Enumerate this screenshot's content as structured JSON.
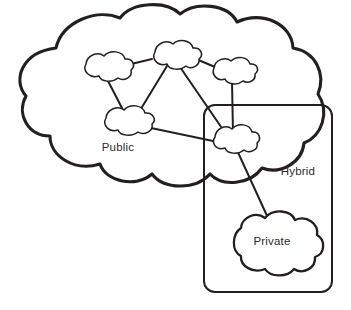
{
  "diagram": {
    "type": "cloud-deployment-models",
    "canvas": {
      "width": 351,
      "height": 310
    },
    "background_color": "#ffffff",
    "stroke_color": "#231f20",
    "text_color": "#2b2b2b",
    "labels": {
      "public": "Public",
      "hybrid": "Hybrid",
      "private": "Private"
    },
    "regions": [
      {
        "name": "public-cloud-region",
        "label": "Public",
        "shape": "cloud",
        "label_position": {
          "x": 118,
          "y": 151
        }
      },
      {
        "name": "hybrid-cloud-region",
        "label": "Hybrid",
        "shape": "rounded-rectangle",
        "label_position": {
          "x": 298,
          "y": 175
        },
        "bounds": {
          "x": 204,
          "y": 105,
          "width": 128,
          "height": 187
        }
      },
      {
        "name": "private-cloud-region",
        "label": "Private",
        "shape": "cloud",
        "label_position": {
          "x": 272,
          "y": 245
        }
      }
    ],
    "nodes": [
      {
        "name": "node-top-left",
        "cx": 105,
        "cy": 69,
        "rx": 28,
        "ry": 12
      },
      {
        "name": "node-top-center",
        "cx": 174,
        "cy": 56,
        "rx": 26,
        "ry": 12
      },
      {
        "name": "node-top-right",
        "cx": 233,
        "cy": 71,
        "rx": 25,
        "ry": 11
      },
      {
        "name": "node-middle-left",
        "cx": 127,
        "cy": 122,
        "rx": 27,
        "ry": 12
      },
      {
        "name": "node-hybrid-bridge",
        "cx": 235,
        "cy": 140,
        "rx": 25,
        "ry": 12
      }
    ],
    "edges": [
      {
        "name": "edge-top-left-to-middle-left",
        "from": "node-top-left",
        "to": "node-middle-left"
      },
      {
        "name": "edge-top-center-to-top-left",
        "from": "node-top-center",
        "to": "node-top-left"
      },
      {
        "name": "edge-top-center-to-middle-left",
        "from": "node-top-center",
        "to": "node-middle-left"
      },
      {
        "name": "edge-top-center-to-top-right",
        "from": "node-top-center",
        "to": "node-top-right"
      },
      {
        "name": "edge-top-center-to-hybrid-bridge",
        "from": "node-top-center",
        "to": "node-hybrid-bridge"
      },
      {
        "name": "edge-top-right-to-hybrid-bridge",
        "from": "node-top-right",
        "to": "node-hybrid-bridge"
      },
      {
        "name": "edge-middle-left-to-hybrid-bridge",
        "from": "node-middle-left",
        "to": "node-hybrid-bridge"
      },
      {
        "name": "edge-hybrid-bridge-to-private",
        "from": "node-hybrid-bridge",
        "to": "private-cloud-region"
      }
    ]
  }
}
